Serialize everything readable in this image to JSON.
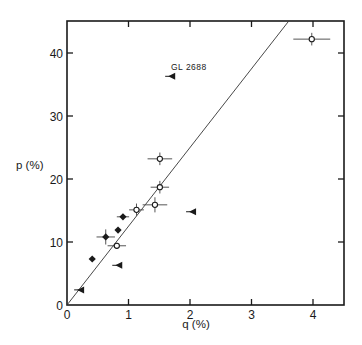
{
  "chart_data": {
    "type": "scatter",
    "title": "",
    "xlabel": "q (%)",
    "ylabel": "p (%)",
    "xlim": [
      0,
      4.45
    ],
    "ylim": [
      0,
      45
    ],
    "x_ticks": [
      0,
      1,
      2,
      3,
      4
    ],
    "y_ticks": [
      0,
      10,
      20,
      30,
      40
    ],
    "x_tick_labels": [
      "0",
      "1",
      "2",
      "3",
      "4"
    ],
    "y_tick_labels": [
      "0",
      "10",
      "20",
      "30",
      "40"
    ],
    "grid": false,
    "legend": null,
    "fit_line": {
      "description": "straight line through origin",
      "slope": 12.5,
      "intercept": 0
    },
    "annotations": [
      {
        "text": "GL 2688",
        "x": 1.75,
        "y": 37.5
      }
    ],
    "series": [
      {
        "name": "open circles",
        "marker": "open-circle",
        "points": [
          {
            "x": 3.98,
            "y": 42.2,
            "xerr": 0.3,
            "yerr": 1.0
          },
          {
            "x": 1.51,
            "y": 23.2,
            "xerr": 0.2,
            "yerr": 1.0
          },
          {
            "x": 1.51,
            "y": 18.7,
            "xerr": 0.15,
            "yerr": 1.0
          },
          {
            "x": 1.43,
            "y": 15.9,
            "xerr": 0.2,
            "yerr": 1.2
          },
          {
            "x": 1.13,
            "y": 15.1,
            "xerr": 0.12,
            "yerr": 1.0
          },
          {
            "x": 0.81,
            "y": 9.4,
            "xerr": 0.15,
            "yerr": 0.5
          }
        ]
      },
      {
        "name": "filled diamonds",
        "marker": "filled-diamond",
        "points": [
          {
            "x": 0.91,
            "y": 14.0,
            "xerr": 0.1,
            "yerr": 0
          },
          {
            "x": 0.83,
            "y": 11.9,
            "xerr": 0,
            "yerr": 0
          },
          {
            "x": 0.63,
            "y": 10.8,
            "xerr": 0.15,
            "yerr": 1.2
          },
          {
            "x": 0.41,
            "y": 7.3,
            "xerr": 0,
            "yerr": 0
          }
        ]
      },
      {
        "name": "filled triangles",
        "marker": "filled-triangle-left",
        "points": [
          {
            "x": 1.71,
            "y": 36.3,
            "label": "GL 2688"
          },
          {
            "x": 2.05,
            "y": 14.8
          },
          {
            "x": 0.85,
            "y": 6.3
          },
          {
            "x": 0.23,
            "y": 2.4
          }
        ]
      }
    ]
  },
  "labels": {
    "x_axis": "q (%)",
    "y_axis": "p (%)",
    "annotation": "GL 2688"
  }
}
